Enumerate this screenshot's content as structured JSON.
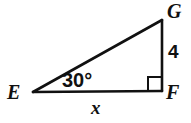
{
  "figure": {
    "type": "right-triangle-diagram",
    "stroke_color": "#111111",
    "background_color": "#ffffff",
    "vertices": {
      "E": {
        "label": "E",
        "x": 33,
        "y": 92
      },
      "F": {
        "label": "F",
        "x": 162,
        "y": 91
      },
      "G": {
        "label": "G",
        "x": 162,
        "y": 20
      }
    },
    "side_labels": {
      "gf": "4",
      "ef": "x"
    },
    "angle_labels": {
      "at_E": "30°"
    },
    "right_angle_at": "F"
  },
  "chart_data": {
    "type": "diagram",
    "title": "",
    "shape": "right triangle EFG",
    "points": [
      {
        "name": "E",
        "x": 33,
        "y": 92
      },
      {
        "name": "F",
        "x": 162,
        "y": 91
      },
      {
        "name": "G",
        "x": 162,
        "y": 20
      }
    ],
    "edges": [
      {
        "from": "E",
        "to": "G",
        "label": ""
      },
      {
        "from": "G",
        "to": "F",
        "label": "4"
      },
      {
        "from": "E",
        "to": "F",
        "label": "x"
      }
    ],
    "angles": [
      {
        "at": "E",
        "label": "30°",
        "value": 30
      },
      {
        "at": "F",
        "label": "right angle",
        "value": 90
      }
    ]
  }
}
